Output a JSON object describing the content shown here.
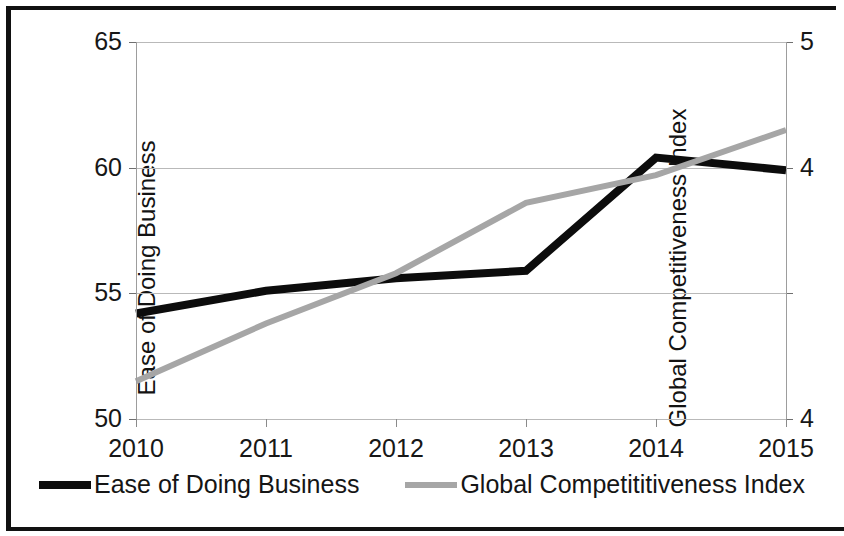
{
  "chart_data": {
    "type": "line",
    "title": "",
    "xlabel": "",
    "categories": [
      "2010",
      "2011",
      "2012",
      "2013",
      "2014",
      "2015"
    ],
    "grid": true,
    "legend_position": "bottom",
    "series": [
      {
        "name": "Ease of Doing Business",
        "legend_label": "Ease of Doing Business",
        "axis": "left",
        "color": "#0c0c0c",
        "values": [
          54.2,
          55.1,
          55.6,
          55.9,
          60.4,
          59.9
        ]
      },
      {
        "name": "Global Competitiveness Index",
        "legend_label": "Global Competititiveness Index",
        "axis": "right",
        "color": "#a6a6a6",
        "values": [
          3.65,
          3.88,
          4.08,
          4.36,
          4.47,
          4.65
        ]
      }
    ],
    "left_axis": {
      "label": "Ease of Doing Business",
      "ticks": [
        "50",
        "55",
        "60",
        "65"
      ],
      "tick_values": [
        50,
        55,
        60,
        65
      ],
      "ylim": [
        50,
        65
      ]
    },
    "right_axis": {
      "label": "Global Competitiveness Index",
      "ticks": [
        "4",
        "",
        "4",
        "5"
      ],
      "tick_values": [
        3.5,
        4.0,
        4.5,
        5.0
      ],
      "ylim": [
        3.5,
        5.0
      ]
    }
  },
  "legend": {
    "items": [
      {
        "label": "Ease of Doing Business",
        "swatch": "line-swatch-black"
      },
      {
        "label": "Global Competititiveness Index",
        "swatch": "line-swatch-grey"
      }
    ]
  }
}
